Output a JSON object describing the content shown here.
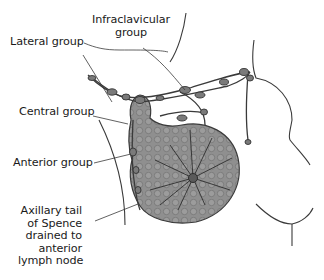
{
  "diagram": {
    "labels": {
      "infraclavicular": [
        "Infraclavicular",
        "group"
      ],
      "lateral": "Lateral group",
      "central": "Central group",
      "anterior": "Anterior group",
      "axillary_tail": [
        "Axillary tail",
        "of Spence",
        "drained to",
        "anterior",
        "lymph node"
      ]
    },
    "colors": {
      "line": "#3a3a3a",
      "breast_fill": "#8f8f8f",
      "breast_shade": "#6e6e6e",
      "node_fill": "#7a7a7a",
      "text": "#1a1a1a",
      "background": "#ffffff"
    }
  }
}
